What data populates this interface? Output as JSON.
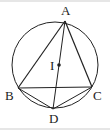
{
  "diagram": {
    "type": "geometry",
    "colors": {
      "stroke": "#222222",
      "background": "#ffffff",
      "border": "#e6e6e6"
    },
    "circle": {
      "cx": 55,
      "cy": 65,
      "r": 43
    },
    "points": {
      "A": {
        "label": "A",
        "x": 65,
        "y": 21
      },
      "B": {
        "label": "B",
        "x": 18,
        "y": 88
      },
      "C": {
        "label": "C",
        "x": 92,
        "y": 87
      },
      "D": {
        "label": "D",
        "x": 53,
        "y": 109
      },
      "I": {
        "label": "I",
        "x": 59,
        "y": 65
      }
    },
    "segments": [
      "AB",
      "AC",
      "BC",
      "AD",
      "BD",
      "CD"
    ]
  }
}
